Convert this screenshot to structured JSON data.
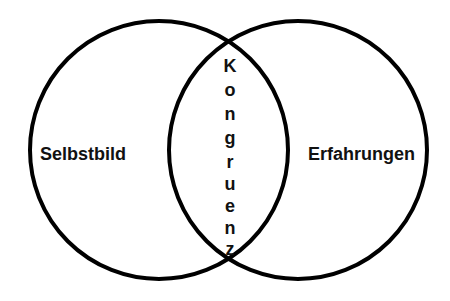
{
  "diagram": {
    "type": "venn",
    "stroke_color": "#000000",
    "background": "#ffffff",
    "circles": [
      {
        "id": "left",
        "label": "Selbstbild",
        "cx": 159,
        "cy": 150,
        "r": 129
      },
      {
        "id": "right",
        "label": "Erfahrungen",
        "cx": 298,
        "cy": 150,
        "r": 129
      }
    ],
    "intersection": {
      "label": "Kongruenz",
      "letters": [
        "K",
        "o",
        "n",
        "g",
        "r",
        "u",
        "e",
        "n",
        "z"
      ]
    }
  }
}
